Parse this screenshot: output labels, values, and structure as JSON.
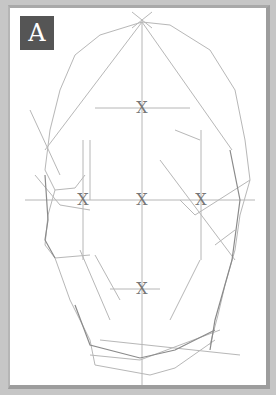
{
  "figure": {
    "label": "A",
    "marks": [
      {
        "id": "brow-center",
        "text": "X",
        "x": 142,
        "y": 108
      },
      {
        "id": "eye-left",
        "text": "X",
        "x": 83,
        "y": 200
      },
      {
        "id": "nose-center",
        "text": "X",
        "x": 142,
        "y": 200
      },
      {
        "id": "eye-right",
        "text": "X",
        "x": 201,
        "y": 200
      },
      {
        "id": "mouth-center",
        "text": "X",
        "x": 142,
        "y": 289
      }
    ],
    "colors": {
      "background": "#c6c6c6",
      "canvas": "#ffffff",
      "label_box": "#555555",
      "label_text": "#ffffff",
      "line": "#9a9a9a",
      "mark": "#777777"
    }
  }
}
